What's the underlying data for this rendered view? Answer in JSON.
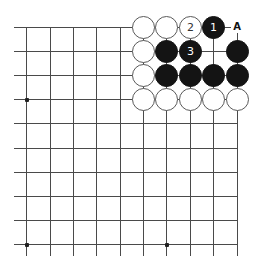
{
  "diagram": {
    "type": "go-board-corner",
    "grid": {
      "columns_x": [
        26,
        50,
        73,
        96,
        120,
        143,
        166,
        190,
        213,
        237
      ],
      "rows_y": [
        27,
        51,
        75,
        99,
        123,
        148,
        172,
        196,
        220,
        244
      ],
      "line_color": "#4a4a4a",
      "left_extend": 14,
      "bottom_extend": 256,
      "edges": [
        "top",
        "right"
      ]
    },
    "star_points": [
      {
        "col": 0,
        "row": 3
      },
      {
        "col": 0,
        "row": 9
      },
      {
        "col": 6,
        "row": 9
      }
    ],
    "stones": [
      {
        "col": 5,
        "row": 0,
        "color": "white",
        "label": ""
      },
      {
        "col": 6,
        "row": 0,
        "color": "white",
        "label": ""
      },
      {
        "col": 7,
        "row": 0,
        "color": "white",
        "label": "2"
      },
      {
        "col": 8,
        "row": 0,
        "color": "black",
        "label": "1"
      },
      {
        "col": 5,
        "row": 1,
        "color": "white",
        "label": ""
      },
      {
        "col": 6,
        "row": 1,
        "color": "black",
        "label": ""
      },
      {
        "col": 7,
        "row": 1,
        "color": "black",
        "label": "3"
      },
      {
        "col": 9,
        "row": 1,
        "color": "black",
        "label": ""
      },
      {
        "col": 5,
        "row": 2,
        "color": "white",
        "label": ""
      },
      {
        "col": 6,
        "row": 2,
        "color": "black",
        "label": ""
      },
      {
        "col": 7,
        "row": 2,
        "color": "black",
        "label": ""
      },
      {
        "col": 8,
        "row": 2,
        "color": "black",
        "label": ""
      },
      {
        "col": 9,
        "row": 2,
        "color": "black",
        "label": ""
      },
      {
        "col": 5,
        "row": 3,
        "color": "white",
        "label": ""
      },
      {
        "col": 6,
        "row": 3,
        "color": "white",
        "label": ""
      },
      {
        "col": 7,
        "row": 3,
        "color": "white",
        "label": ""
      },
      {
        "col": 8,
        "row": 3,
        "color": "white",
        "label": ""
      },
      {
        "col": 9,
        "row": 3,
        "color": "white",
        "label": ""
      }
    ],
    "point_labels": [
      {
        "col": 9,
        "row": 0,
        "text": "A"
      }
    ],
    "colors": {
      "black_stone": "#141414",
      "white_stone": "#ffffff",
      "white_outline": "#5a5a5a"
    }
  }
}
